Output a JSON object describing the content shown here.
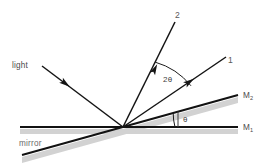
{
  "figure": {
    "type": "optics-ray-diagram",
    "background_color": "#ffffff",
    "line_color": "#1a1a1a",
    "shadow_color": "#c9c9c9",
    "text_color": "#4a4a4a"
  },
  "labels": {
    "light": "light",
    "mirror": "mirror",
    "ray_one": "1",
    "ray_two": "2",
    "mirror_one": "M",
    "mirror_one_sub": "1",
    "mirror_two": "M",
    "mirror_two_sub": "2",
    "angle_theta": "θ",
    "angle_two_theta": "2θ"
  },
  "geometry": {
    "origin": {
      "x": 123,
      "y": 127
    },
    "incident_ray": {
      "x1": 42,
      "y1": 66,
      "x2": 123,
      "y2": 127,
      "arrow_at": {
        "x": 65,
        "y": 83
      }
    },
    "reflected_ray_1": {
      "x1": 123,
      "y1": 127,
      "x2": 226,
      "y2": 57,
      "arrow_at": {
        "x": 187,
        "y": 84
      }
    },
    "reflected_ray_2": {
      "x1": 123,
      "y1": 127,
      "x2": 175,
      "y2": 22,
      "arrow_at": {
        "x": 156,
        "y": 62
      }
    },
    "mirror_1_line": {
      "x1": 20,
      "y1": 127,
      "x2": 238,
      "y2": 127
    },
    "mirror_2_line": {
      "x1": 22,
      "y1": 155,
      "x2": 238,
      "y2": 95
    },
    "theta_vertical_tick": {
      "x": 178,
      "y1": 112,
      "y2": 127
    },
    "theta_arc_radius": 52,
    "two_theta_arc_radius": 72
  },
  "angles": {
    "theta_label_pos": {
      "x": 184,
      "y": 120
    },
    "two_theta_label_pos": {
      "x": 164,
      "y": 81
    }
  }
}
